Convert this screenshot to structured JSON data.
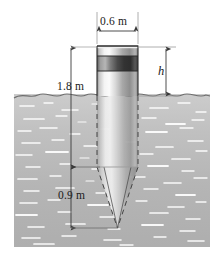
{
  "figure": {
    "labels": {
      "width": "0.6 m",
      "submerged_depth": "1.8 m",
      "cone_height": "0.9 m",
      "freeboard": "h"
    },
    "icons": {
      "width_dimension": "double-arrow-horizontal-icon",
      "depth_dimension": "double-arrow-vertical-icon",
      "cone_dimension": "double-arrow-vertical-icon",
      "freeboard_dimension": "double-arrow-vertical-icon",
      "water_surface": "wavy-line-icon",
      "buoy_body": "cylinder-with-cone-icon"
    },
    "colors": {
      "water": "#b9b9b9",
      "water_highlight": "#ffffff",
      "metal_light": "#f2f2f2",
      "metal_mid": "#9a9a9a",
      "metal_dark": "#3a3a3a",
      "outline": "#2b2b2b",
      "dimension_line": "#4a4a4a",
      "background": "#ffffff"
    },
    "geometry": {
      "cylinder_left": 97,
      "cylinder_right": 138,
      "cylinder_top": 46,
      "waterline_y": 96,
      "cone_top_y": 167,
      "cone_tip_y": 228,
      "cone_tip_x": 117,
      "water_left": 14,
      "water_right": 210,
      "water_bottom": 247
    }
  }
}
